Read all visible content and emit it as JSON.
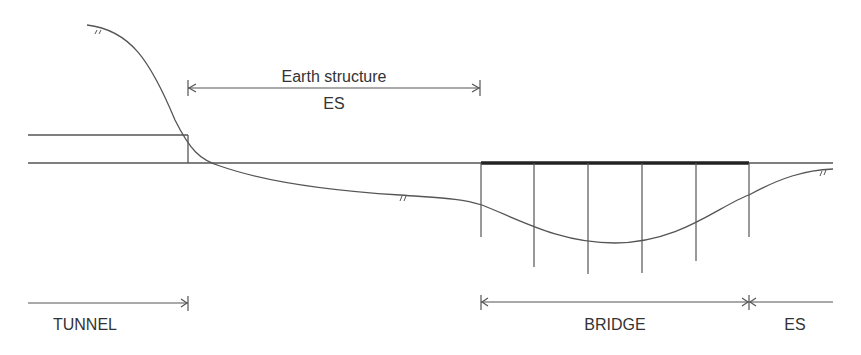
{
  "diagram": {
    "type": "longitudinal-profile",
    "labels": {
      "earth_structure_title": "Earth structure",
      "earth_structure_abbr": "ES",
      "tunnel": "TUNNEL",
      "bridge": "BRIDGE",
      "es_right": "ES"
    },
    "colors": {
      "line": "#555555",
      "deck": "#222222",
      "text": "#333333"
    },
    "bridge": {
      "piers": 6
    }
  }
}
